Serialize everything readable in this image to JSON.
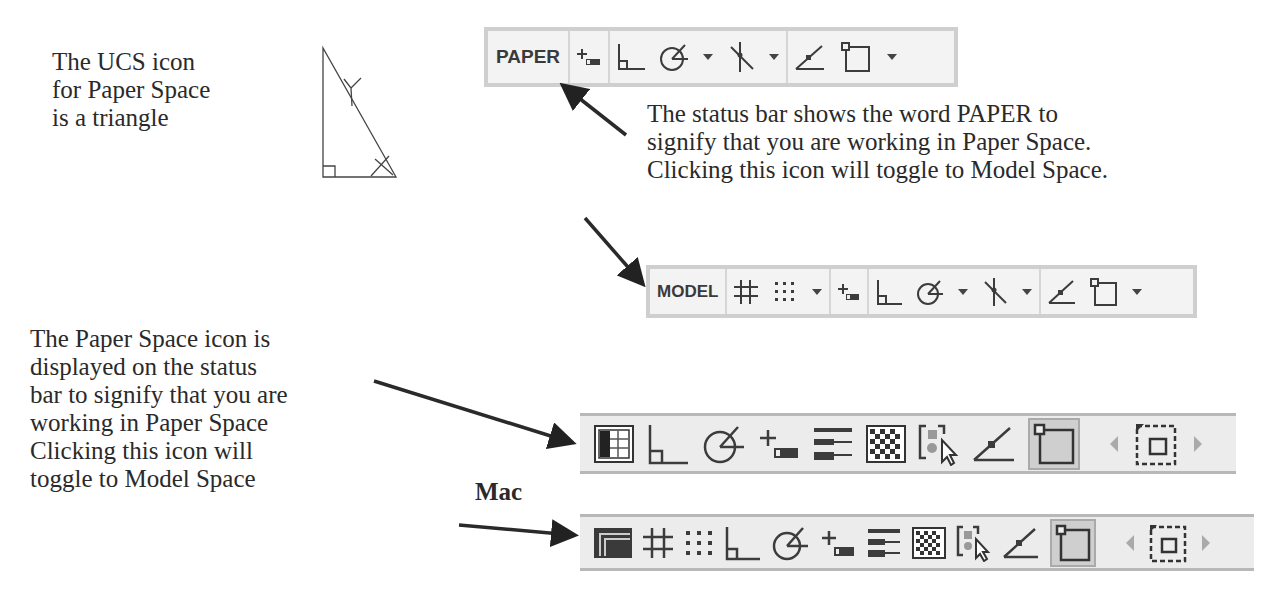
{
  "captions": {
    "ucs_icon": "The UCS icon\nfor Paper Space\nis a triangle",
    "status_bar_paper": "The status bar shows the word PAPER to\nsignify that you are working in Paper Space.\nClicking this icon will toggle to Model Space.",
    "paper_space_icon": "The Paper Space icon is\ndisplayed on the status\nbar to signify that you are\nworking in Paper Space\nClicking this icon will\ntoggle to Model Space",
    "mac_label": "Mac"
  },
  "toolbars": {
    "paper": {
      "space_label": "PAPER",
      "icons": [
        "dynamic-input-icon",
        "ortho-icon",
        "polar-tracking-icon",
        "dropdown-icon",
        "object-snap-tracking-icon",
        "dropdown-icon",
        "object-snap-icon",
        "viewport-icon",
        "dropdown-icon"
      ]
    },
    "model": {
      "space_label": "MODEL",
      "icons": [
        "grid-icon",
        "snap-icon",
        "dropdown-icon",
        "dynamic-input-icon",
        "ortho-icon",
        "polar-tracking-icon",
        "dropdown-icon",
        "object-snap-tracking-icon",
        "dropdown-icon",
        "object-snap-icon",
        "viewport-icon",
        "dropdown-icon"
      ]
    },
    "legacy": {
      "icons": [
        "paper-space-icon",
        "ortho-icon",
        "polar-tracking-icon",
        "dynamic-input-icon",
        "lineweight-icon",
        "transparency-icon",
        "selection-cycling-icon",
        "object-snap-icon",
        "viewport-icon",
        "scroll-left-icon",
        "zoom-window-icon",
        "scroll-right-icon"
      ]
    },
    "mac": {
      "icons": [
        "paper-space-icon",
        "grid-icon",
        "snap-icon",
        "ortho-icon",
        "polar-tracking-icon",
        "dynamic-input-icon",
        "lineweight-icon",
        "transparency-icon",
        "selection-cycling-icon",
        "object-snap-icon",
        "viewport-icon",
        "scroll-left-icon",
        "zoom-window-icon",
        "scroll-right-icon"
      ]
    }
  },
  "colors": {
    "text": "#2a2a2a",
    "toolbar_bg": "#f3f3f3",
    "toolbar_border": "#cfcfcf",
    "icon": "#3c3c3c",
    "active_bg": "#cfcfcf"
  }
}
